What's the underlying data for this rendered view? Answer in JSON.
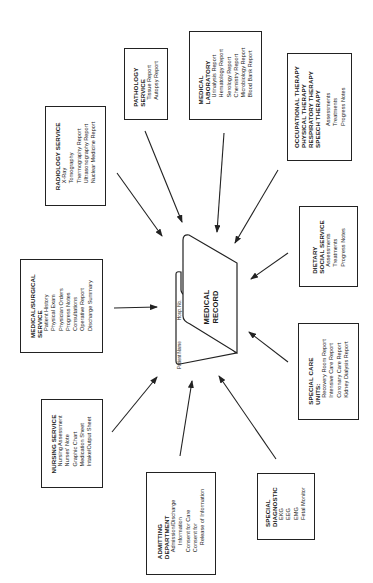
{
  "center": {
    "title_line1": "MEDICAL",
    "title_line2": "RECORD",
    "tab_label_left": "Patient Name",
    "tab_label_right": "Hosp. No."
  },
  "boxes": {
    "radiology": {
      "title": "RADIOLOGY SERVICE",
      "items": [
        "X-Ray",
        "Tomography",
        "Thermography Report",
        "Ultrasonography Report",
        "Nuclear Medicine Report"
      ]
    },
    "pathology": {
      "title_line1": "PATHOLOGY",
      "title_line2": "SERVICE",
      "items": [
        "Tissue Report",
        "Autopsy Report"
      ]
    },
    "laboratory": {
      "title_line1": "MEDICAL",
      "title_line2": "LABORATORY",
      "items": [
        "Urinalysis Report",
        "Hematology Report",
        "Serology Report",
        "Chemistry Report",
        "Microbiology Report",
        "Blood Bank Report"
      ]
    },
    "therapy": {
      "titles": [
        "OCCUPATIONAL THERAPY",
        "PHYSICAL THERAPY",
        "RESPIRATORY THERAPY",
        "SPEECH THERAPY"
      ],
      "items": [
        "Assessments",
        "Treatments",
        "Progress Notes"
      ]
    },
    "medsurg": {
      "title_line1": "MEDICAL/SURGICAL",
      "title_line2": "SERVICE",
      "items": [
        "Patient History",
        "Physical Exam",
        "Physician Orders",
        "Progress Notes",
        "Consultations",
        "Operative Report",
        "Discharge Summary"
      ]
    },
    "dietary": {
      "title_line1": "DIETARY",
      "title_line2": "SOCIAL SERVICE",
      "items": [
        "Assessments",
        "Treatments",
        "Progress Notes"
      ]
    },
    "specialcare": {
      "title_line1": "SPECIAL CARE",
      "title_line2": "UNITS:",
      "items": [
        "Recovery Room Report",
        "Intensive Care Report",
        "Coronary Care Report",
        "Kidney Dialysis Report"
      ]
    },
    "nursing": {
      "title": "NURSING SERVICE",
      "items": [
        "Nursing Assessment",
        "Nurses' Note",
        "Graphic Chart",
        "Medication Sheet",
        "Intake/Output Sheet"
      ]
    },
    "admitting": {
      "title_line1": "ADMITTING",
      "title_line2": "DEPARTMENT",
      "items": [
        "Admission/Discharge",
        "Information",
        "Consent for Care",
        "Consent for",
        "Release of Information"
      ]
    },
    "diagnostic": {
      "title_line1": "SPECIAL",
      "title_line2": "DIAGNOSTIC",
      "items": [
        "EKG",
        "EEG",
        "EMG",
        "Fetal Monitor"
      ]
    }
  }
}
